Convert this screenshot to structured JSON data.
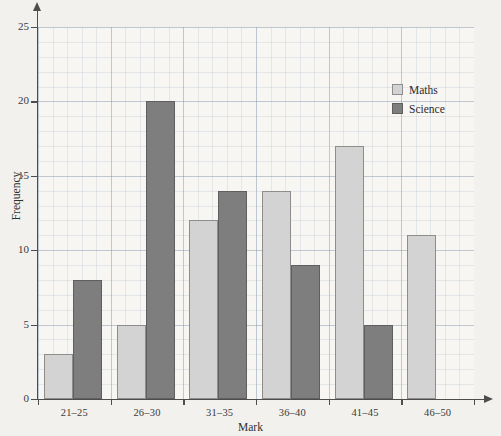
{
  "chart_data": {
    "type": "bar",
    "title": "",
    "subtitle": "",
    "xlabel": "Mark",
    "ylabel": "Frequency",
    "categories": [
      "21–25",
      "26–30",
      "31–35",
      "36–40",
      "41–45",
      "46–50"
    ],
    "series": [
      {
        "name": "Maths",
        "color": "#d3d3d3",
        "values": [
          3,
          5,
          12,
          14,
          17,
          11
        ]
      },
      {
        "name": "Science",
        "color": "#7e7e7e",
        "values": [
          8,
          20,
          14,
          9,
          5,
          null
        ]
      }
    ],
    "ylim": [
      0,
      25
    ],
    "ytick_values": [
      0,
      5,
      10,
      15,
      20,
      25
    ],
    "ytick_labels": [
      "0",
      "5",
      "10",
      "15",
      "20",
      "25"
    ],
    "ytick_step": 5,
    "minor_gridline_step": 1,
    "grid": true,
    "grid_style": "graph-paper",
    "legend_position": "top-right-inside",
    "axis_arrows": true,
    "annotations": []
  },
  "legend": {
    "entries": [
      {
        "label": "Maths",
        "swatch": "maths-swatch"
      },
      {
        "label": "Science",
        "swatch": "science-swatch"
      }
    ]
  },
  "axes": {
    "x_title": "Mark",
    "y_title": "Frequency"
  }
}
